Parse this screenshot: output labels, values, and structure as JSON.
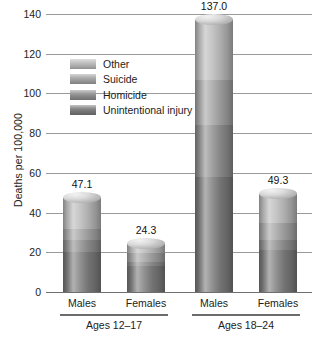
{
  "chart_data": {
    "type": "bar",
    "subtype": "stacked-column-cylinder",
    "title": "",
    "xlabel": "",
    "ylabel": "Deaths per 100,000",
    "ylim": [
      0,
      140
    ],
    "yticks": [
      0,
      20,
      40,
      60,
      80,
      100,
      120,
      140
    ],
    "ytick_labels": [
      "0",
      "20",
      "40",
      "60",
      "80",
      "100",
      "120",
      "140"
    ],
    "grid": true,
    "legend_position": "upper-left-inside",
    "categories": [
      "Males",
      "Females",
      "Males",
      "Females"
    ],
    "groups": [
      {
        "label": "Ages 12–17",
        "categories": [
          "Males",
          "Females"
        ]
      },
      {
        "label": "Ages 18–24",
        "categories": [
          "Males",
          "Females"
        ]
      }
    ],
    "series": [
      {
        "name": "Unintentional injury",
        "color": "#7b7b7b",
        "values": [
          20.0,
          13.0,
          58.0,
          21.0
        ]
      },
      {
        "name": "Homicide",
        "color": "#8e8e8e",
        "values": [
          6.0,
          2.0,
          26.0,
          5.0
        ]
      },
      {
        "name": "Suicide",
        "color": "#a3a3a3",
        "values": [
          5.5,
          4.5,
          23.0,
          9.0
        ]
      },
      {
        "name": "Other",
        "color": "#b9b9b9",
        "values": [
          15.6,
          4.8,
          30.0,
          14.3
        ]
      }
    ],
    "totals": [
      47.1,
      24.3,
      137.0,
      49.3
    ],
    "total_labels": [
      "47.1",
      "24.3",
      "137.0",
      "49.3"
    ]
  },
  "legend": {
    "items": [
      {
        "label": "Other",
        "swatch_class": "s-other",
        "color": "#b9b9b9"
      },
      {
        "label": "Suicide",
        "swatch_class": "s-suicide",
        "color": "#a3a3a3"
      },
      {
        "label": "Homicide",
        "swatch_class": "s-homicide",
        "color": "#8e8e8e"
      },
      {
        "label": "Unintentional injury",
        "swatch_class": "s-unint",
        "color": "#7b7b7b"
      }
    ]
  },
  "axis": {
    "y_title": "Deaths per 100,000"
  }
}
